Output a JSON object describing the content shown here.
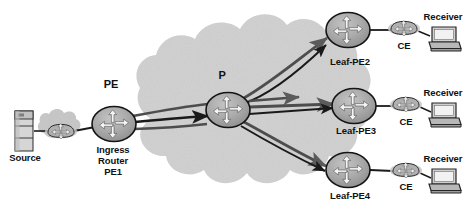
{
  "diagram": {
    "colors": {
      "cloud_fill": "#d2d2d2",
      "cloud_fill_small": "#c9c9c9",
      "node_fill": "#a8a8a8",
      "node_stroke": "#1a1a1a",
      "link_dark": "#1a1a1a",
      "link_gray": "#555555",
      "text": "#111111",
      "device_light": "#d8d8d8",
      "device_mid": "#9a9a9a",
      "device_dark": "#4a4a4a",
      "background": "#ffffff"
    },
    "labels": {
      "source": "Source",
      "pe_cloud_edge": "PE",
      "core_router": "P",
      "ingress_router_line1": "Ingress",
      "ingress_router_line2": "Router",
      "ingress_router_line3": "PE1",
      "leaf_pe2": "Leaf-PE2",
      "leaf_pe3": "Leaf-PE3",
      "leaf_pe4": "Leaf-PE4",
      "ce2": "CE",
      "ce3": "CE",
      "ce4": "CE",
      "receiver2": "Receiver",
      "receiver3": "Receiver",
      "receiver4": "Receiver"
    },
    "nodes": [
      {
        "id": "source-server",
        "name": "Source",
        "type": "server",
        "x": 24,
        "y": 131
      },
      {
        "id": "source-router",
        "name": "source-edge-router",
        "type": "router-small",
        "x": 61,
        "y": 131
      },
      {
        "id": "pe1",
        "name": "Ingress Router PE1",
        "type": "router-cross",
        "x": 114,
        "y": 124
      },
      {
        "id": "p",
        "name": "P",
        "type": "router-cross",
        "x": 228,
        "y": 110
      },
      {
        "id": "leaf-pe2",
        "name": "Leaf-PE2",
        "type": "router-cross",
        "x": 348,
        "y": 30
      },
      {
        "id": "leaf-pe3",
        "name": "Leaf-PE3",
        "type": "router-cross",
        "x": 354,
        "y": 106
      },
      {
        "id": "leaf-pe4",
        "name": "Leaf-PE4",
        "type": "router-cross",
        "x": 348,
        "y": 170
      },
      {
        "id": "ce2",
        "name": "CE",
        "type": "router-small",
        "x": 404,
        "y": 28
      },
      {
        "id": "ce3",
        "name": "CE",
        "type": "router-small",
        "x": 406,
        "y": 104
      },
      {
        "id": "ce4",
        "name": "CE",
        "type": "router-small",
        "x": 406,
        "y": 170
      },
      {
        "id": "receiver2",
        "name": "Receiver",
        "type": "workstation",
        "x": 442,
        "y": 38
      },
      {
        "id": "receiver3",
        "name": "Receiver",
        "type": "workstation",
        "x": 442,
        "y": 114
      },
      {
        "id": "receiver4",
        "name": "Receiver",
        "type": "workstation",
        "x": 442,
        "y": 180
      }
    ],
    "links": [
      {
        "from": "source-server",
        "to": "source-router",
        "style": "plain"
      },
      {
        "from": "source-router",
        "to": "pe1",
        "style": "plain"
      },
      {
        "from": "pe1",
        "to": "p",
        "style": "bundle",
        "count": 3
      },
      {
        "from": "p",
        "to": "leaf-pe2",
        "style": "arrow-curved",
        "count": 2
      },
      {
        "from": "p",
        "to": "leaf-pe3",
        "style": "arrow-straight",
        "count": 3
      },
      {
        "from": "p",
        "to": "leaf-pe4",
        "style": "arrow-curved",
        "count": 2
      },
      {
        "from": "leaf-pe2",
        "to": "ce2",
        "style": "plain"
      },
      {
        "from": "leaf-pe3",
        "to": "ce3",
        "style": "plain"
      },
      {
        "from": "leaf-pe4",
        "to": "ce4",
        "style": "plain"
      },
      {
        "from": "ce2",
        "to": "receiver2",
        "style": "plain"
      },
      {
        "from": "ce3",
        "to": "receiver3",
        "style": "plain"
      },
      {
        "from": "ce4",
        "to": "receiver4",
        "style": "plain"
      }
    ]
  }
}
